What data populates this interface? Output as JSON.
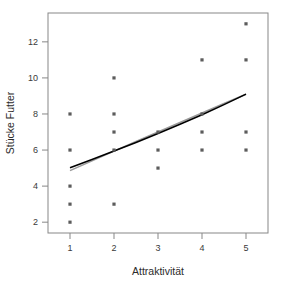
{
  "chart_data": {
    "type": "scatter",
    "title": "",
    "subtitle": "",
    "xlabel": "Attraktivität",
    "ylabel": "Stücke Futter",
    "xlim": [
      0.5,
      5.5
    ],
    "ylim": [
      1.4,
      13.6
    ],
    "xticks": [
      1,
      2,
      3,
      4,
      5
    ],
    "xtick_labels": [
      "1",
      "2",
      "3",
      "4",
      "5"
    ],
    "yticks": [
      2,
      4,
      6,
      8,
      10,
      12
    ],
    "ytick_labels": [
      "2",
      "4",
      "6",
      "8",
      "10",
      "12"
    ],
    "grid": false,
    "legend": null,
    "marker": "square",
    "marker_color": "#5c5c5c",
    "points": [
      {
        "x": 1,
        "y": 8
      },
      {
        "x": 1,
        "y": 6
      },
      {
        "x": 1,
        "y": 4
      },
      {
        "x": 1,
        "y": 3
      },
      {
        "x": 1,
        "y": 2
      },
      {
        "x": 2,
        "y": 10
      },
      {
        "x": 2,
        "y": 8
      },
      {
        "x": 2,
        "y": 7
      },
      {
        "x": 2,
        "y": 6
      },
      {
        "x": 2,
        "y": 3
      },
      {
        "x": 3,
        "y": 7
      },
      {
        "x": 3,
        "y": 6
      },
      {
        "x": 3,
        "y": 5
      },
      {
        "x": 4,
        "y": 11
      },
      {
        "x": 4,
        "y": 8
      },
      {
        "x": 4,
        "y": 7
      },
      {
        "x": 4,
        "y": 6
      },
      {
        "x": 5,
        "y": 13
      },
      {
        "x": 5,
        "y": 11
      },
      {
        "x": 5,
        "y": 7
      },
      {
        "x": 5,
        "y": 6
      }
    ],
    "series": [
      {
        "name": "fit-primary",
        "type": "line",
        "color": "#000000",
        "x": [
          1.0,
          1.5,
          2.0,
          2.5,
          3.0,
          3.5,
          4.0,
          4.5,
          5.0
        ],
        "y": [
          5.02,
          5.48,
          5.95,
          6.42,
          6.92,
          7.43,
          7.96,
          8.52,
          9.1
        ]
      },
      {
        "name": "fit-secondary",
        "type": "line",
        "color": "#9a9a9a",
        "x": [
          1.0,
          1.5,
          2.0,
          2.5,
          3.0,
          3.5,
          4.0,
          4.5,
          5.0
        ],
        "y": [
          4.86,
          5.4,
          5.94,
          6.47,
          7.0,
          7.53,
          8.05,
          8.58,
          9.1
        ]
      }
    ],
    "frame": {
      "left": 48,
      "right": 268,
      "top": 13,
      "bottom": 233,
      "color": "#878787"
    }
  }
}
